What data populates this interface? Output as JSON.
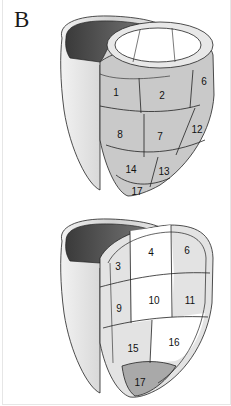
{
  "panel": {
    "label": "B"
  },
  "colors": {
    "shaded_segment": "#c9c9c9",
    "white_segment": "#ffffff",
    "light_segment": "#e3e3e3",
    "apex_segment": "#a9a9a9",
    "cavity_dark": "#4a4a4a",
    "outline": "#222222",
    "rv_wall": "#d8d8d8"
  },
  "top_heart": {
    "title": "Anterior view",
    "segments": [
      {
        "id": "1",
        "label": "1",
        "fill": "shaded"
      },
      {
        "id": "2",
        "label": "2",
        "fill": "shaded"
      },
      {
        "id": "6",
        "label": "6",
        "fill": "shaded"
      },
      {
        "id": "8",
        "label": "8",
        "fill": "shaded"
      },
      {
        "id": "7",
        "label": "7",
        "fill": "shaded"
      },
      {
        "id": "12",
        "label": "12",
        "fill": "shaded"
      },
      {
        "id": "14",
        "label": "14",
        "fill": "shaded"
      },
      {
        "id": "13",
        "label": "13",
        "fill": "shaded"
      },
      {
        "id": "17",
        "label": "17",
        "fill": "shaded"
      }
    ]
  },
  "bottom_heart": {
    "segments": [
      {
        "id": "3",
        "label": "3",
        "fill": "light"
      },
      {
        "id": "4",
        "label": "4",
        "fill": "white"
      },
      {
        "id": "6",
        "label": "6",
        "fill": "light"
      },
      {
        "id": "9",
        "label": "9",
        "fill": "light"
      },
      {
        "id": "10",
        "label": "10",
        "fill": "white"
      },
      {
        "id": "11",
        "label": "11",
        "fill": "light"
      },
      {
        "id": "15",
        "label": "15",
        "fill": "light"
      },
      {
        "id": "16",
        "label": "16",
        "fill": "white"
      },
      {
        "id": "17",
        "label": "17",
        "fill": "apex"
      }
    ]
  }
}
